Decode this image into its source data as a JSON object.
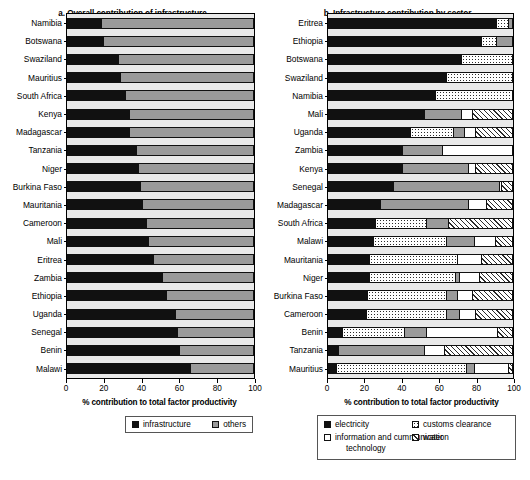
{
  "chart_data": [
    {
      "type": "bar",
      "panel": "a",
      "title": "a. Overall contribution of infrastructure",
      "orientation": "horizontal",
      "stacked": true,
      "xlabel": "% contribution to total factor productivity",
      "ylabel": "",
      "xlim": [
        0,
        100
      ],
      "xticks": [
        0,
        20,
        40,
        60,
        80,
        100
      ],
      "xticklabels": [
        "0",
        "20",
        "40",
        "60",
        "80",
        "100"
      ],
      "grid": false,
      "legend_position": "bottom",
      "categories": [
        "Namibia",
        "Botswana",
        "Swaziland",
        "Mauritius",
        "South Africa",
        "Kenya",
        "Madagascar",
        "Tanzania",
        "Niger",
        "Burkina Faso",
        "Mauritania",
        "Cameroon",
        "Mali",
        "Eritrea",
        "Zambia",
        "Ethiopia",
        "Uganda",
        "Senegal",
        "Benin",
        "Malawi"
      ],
      "series": [
        {
          "name": "infrastructure",
          "fill": "black",
          "color": "#111111",
          "values": [
            18,
            19,
            27,
            28,
            31,
            33,
            33,
            37,
            38,
            39,
            40,
            42,
            43,
            46,
            51,
            53,
            58,
            59,
            60,
            66
          ]
        },
        {
          "name": "others",
          "fill": "gray",
          "color": "#9a9a9a",
          "values": [
            82,
            81,
            73,
            72,
            69,
            67,
            67,
            63,
            62,
            61,
            60,
            58,
            57,
            54,
            49,
            47,
            42,
            41,
            40,
            34
          ]
        }
      ]
    },
    {
      "type": "bar",
      "panel": "b",
      "title": "b. Infrastructure contribution by sector",
      "orientation": "horizontal",
      "stacked": true,
      "xlabel": "% contribution to total factor productivity",
      "ylabel": "",
      "xlim": [
        0,
        100
      ],
      "xticks": [
        0,
        20,
        40,
        60,
        80,
        100
      ],
      "xticklabels": [
        "0",
        "20",
        "40",
        "60",
        "80",
        "100"
      ],
      "grid": false,
      "legend_position": "bottom",
      "categories": [
        "Eritrea",
        "Ethiopia",
        "Botswana",
        "Swaziland",
        "Namibia",
        "Mali",
        "Uganda",
        "Zambia",
        "Kenya",
        "Senegal",
        "Madagascar",
        "South Africa",
        "Malawi",
        "Mauritania",
        "Niger",
        "Burkina Faso",
        "Cameroon",
        "Benin",
        "Tanzania",
        "Mauritius"
      ],
      "series": [
        {
          "name": "electricity",
          "fill": "black",
          "color": "#111111",
          "values": [
            91,
            83,
            72,
            64,
            58,
            52,
            44,
            40,
            40,
            35,
            28,
            25,
            24,
            22,
            22,
            21,
            20,
            7,
            5,
            4
          ]
        },
        {
          "name": "customs clearance",
          "fill": "dots",
          "color": "#ffffff",
          "values": [
            7,
            8,
            28,
            36,
            42,
            0,
            24,
            0,
            0,
            0,
            0,
            28,
            40,
            48,
            47,
            43,
            44,
            34,
            0,
            71
          ]
        },
        {
          "name": "transportation",
          "fill": "gray",
          "color": "#9a9a9a",
          "values": [
            2,
            9,
            0,
            0,
            0,
            20,
            6,
            22,
            36,
            58,
            48,
            12,
            15,
            0,
            2,
            6,
            7,
            12,
            47,
            4
          ]
        },
        {
          "name": "information and cummunication technology",
          "fill": "white",
          "color": "#ffffff",
          "values": [
            0,
            0,
            0,
            0,
            0,
            6,
            6,
            38,
            4,
            1,
            10,
            0,
            12,
            13,
            11,
            8,
            9,
            39,
            11,
            19
          ]
        },
        {
          "name": "water",
          "fill": "hatch",
          "color": "#ffffff",
          "values": [
            0,
            0,
            0,
            0,
            0,
            22,
            20,
            0,
            20,
            6,
            14,
            35,
            9,
            17,
            18,
            22,
            20,
            8,
            37,
            2
          ]
        }
      ]
    }
  ],
  "panel_a": {
    "title": "a. Overall contribution of infrastructure",
    "axis_title": "% contribution to total factor productivity",
    "xticklabels": [
      "0",
      "20",
      "40",
      "60",
      "80",
      "100"
    ],
    "rows": [
      {
        "label": "Namibia",
        "segments": [
          18,
          82
        ]
      },
      {
        "label": "Botswana",
        "segments": [
          19,
          81
        ]
      },
      {
        "label": "Swaziland",
        "segments": [
          27,
          73
        ]
      },
      {
        "label": "Mauritius",
        "segments": [
          28,
          72
        ]
      },
      {
        "label": "South Africa",
        "segments": [
          31,
          69
        ]
      },
      {
        "label": "Kenya",
        "segments": [
          33,
          67
        ]
      },
      {
        "label": "Madagascar",
        "segments": [
          33,
          67
        ]
      },
      {
        "label": "Tanzania",
        "segments": [
          37,
          63
        ]
      },
      {
        "label": "Niger",
        "segments": [
          38,
          62
        ]
      },
      {
        "label": "Burkina Faso",
        "segments": [
          39,
          61
        ]
      },
      {
        "label": "Mauritania",
        "segments": [
          40,
          60
        ]
      },
      {
        "label": "Cameroon",
        "segments": [
          42,
          58
        ]
      },
      {
        "label": "Mali",
        "segments": [
          43,
          57
        ]
      },
      {
        "label": "Eritrea",
        "segments": [
          46,
          54
        ]
      },
      {
        "label": "Zambia",
        "segments": [
          51,
          49
        ]
      },
      {
        "label": "Ethiopia",
        "segments": [
          53,
          47
        ]
      },
      {
        "label": "Uganda",
        "segments": [
          58,
          42
        ]
      },
      {
        "label": "Senegal",
        "segments": [
          59,
          41
        ]
      },
      {
        "label": "Benin",
        "segments": [
          60,
          40
        ]
      },
      {
        "label": "Malawi",
        "segments": [
          66,
          34
        ]
      }
    ],
    "legend": [
      {
        "label": "infrastructure",
        "fill": "black"
      },
      {
        "label": "others",
        "fill": "gray"
      }
    ]
  },
  "panel_b": {
    "title": "b. Infrastructure contribution by sector",
    "axis_title": "% contribution to total factor productivity",
    "xticklabels": [
      "0",
      "20",
      "40",
      "60",
      "80",
      "100"
    ],
    "rows": [
      {
        "label": "Eritrea",
        "segments": [
          91,
          7,
          2,
          0,
          0
        ]
      },
      {
        "label": "Ethiopia",
        "segments": [
          83,
          8,
          9,
          0,
          0
        ]
      },
      {
        "label": "Botswana",
        "segments": [
          72,
          28,
          0,
          0,
          0
        ]
      },
      {
        "label": "Swaziland",
        "segments": [
          64,
          36,
          0,
          0,
          0
        ]
      },
      {
        "label": "Namibia",
        "segments": [
          58,
          42,
          0,
          0,
          0
        ]
      },
      {
        "label": "Mali",
        "segments": [
          52,
          0,
          20,
          6,
          22
        ]
      },
      {
        "label": "Uganda",
        "segments": [
          44,
          24,
          6,
          6,
          20
        ]
      },
      {
        "label": "Zambia",
        "segments": [
          40,
          0,
          22,
          38,
          0
        ]
      },
      {
        "label": "Kenya",
        "segments": [
          40,
          0,
          36,
          4,
          20
        ]
      },
      {
        "label": "Senegal",
        "segments": [
          35,
          0,
          58,
          1,
          6
        ]
      },
      {
        "label": "Madagascar",
        "segments": [
          28,
          0,
          48,
          10,
          14
        ]
      },
      {
        "label": "South Africa",
        "segments": [
          25,
          28,
          12,
          0,
          35
        ]
      },
      {
        "label": "Malawi",
        "segments": [
          24,
          40,
          15,
          12,
          9
        ]
      },
      {
        "label": "Mauritania",
        "segments": [
          22,
          48,
          0,
          13,
          17
        ]
      },
      {
        "label": "Niger",
        "segments": [
          22,
          47,
          2,
          11,
          18
        ]
      },
      {
        "label": "Burkina Faso",
        "segments": [
          21,
          43,
          6,
          8,
          22
        ]
      },
      {
        "label": "Cameroon",
        "segments": [
          20,
          44,
          7,
          9,
          20
        ]
      },
      {
        "label": "Benin",
        "segments": [
          7,
          34,
          12,
          39,
          8
        ]
      },
      {
        "label": "Tanzania",
        "segments": [
          5,
          0,
          47,
          11,
          37
        ]
      },
      {
        "label": "Mauritius",
        "segments": [
          4,
          71,
          4,
          19,
          2
        ]
      }
    ],
    "legend": [
      {
        "label": "electricity",
        "fill": "black"
      },
      {
        "label": "customs clearance",
        "fill": "dots"
      },
      {
        "label": "transportation",
        "fill": "gray"
      },
      {
        "label": "information and cummunication",
        "label2": "technology",
        "fill": "white"
      },
      {
        "label": "water",
        "fill": "hatch"
      }
    ]
  }
}
